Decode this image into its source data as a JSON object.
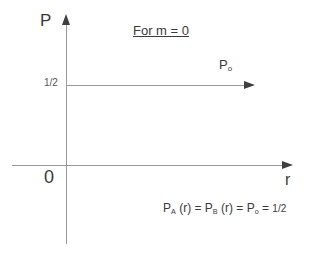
{
  "figure": {
    "title": "For m = 0",
    "axes": {
      "y_label": "P",
      "x_label": "r",
      "origin_label": "0",
      "y_tick_label": "1/2"
    },
    "series": {
      "p0_label_base": "P",
      "p0_label_sub": "o"
    },
    "equation": {
      "p_a_base": "P",
      "p_a_sub": "A",
      "p_a_arg": " (r)",
      "equals_1": "  =  ",
      "p_b_base": "P",
      "p_b_sub": "B",
      "p_b_arg": " (r)",
      "equals_2": " = ",
      "p_o_base": "P",
      "p_o_sub": "o",
      "equals_3": " = ",
      "value": "1/2"
    },
    "colors": {
      "axis": "#9a9a9a",
      "arrow": "#3f3f3f",
      "text": "#3a3a3a",
      "background": "#ffffff"
    }
  }
}
